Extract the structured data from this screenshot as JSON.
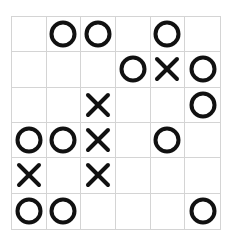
{
  "game": {
    "rows": 6,
    "cols": 6,
    "board": [
      [
        "",
        "O",
        "O",
        "",
        "O",
        ""
      ],
      [
        "",
        "",
        "",
        "O",
        "X",
        "O"
      ],
      [
        "",
        "",
        "X",
        "",
        "",
        "O"
      ],
      [
        "O",
        "O",
        "X",
        "",
        "O",
        ""
      ],
      [
        "X",
        "",
        "X",
        "",
        "",
        ""
      ],
      [
        "O",
        "O",
        "",
        "",
        "",
        "O"
      ]
    ]
  },
  "colors": {
    "grid_line": "#d4d4d4",
    "mark": "#111111",
    "background": "#ffffff"
  }
}
